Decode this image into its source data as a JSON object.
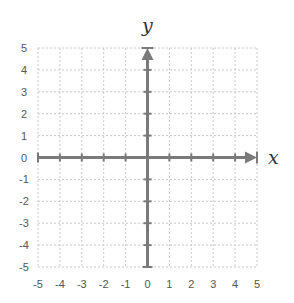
{
  "chart_data": {
    "type": "scatter",
    "title": "",
    "xlabel": "x",
    "ylabel": "y",
    "xlim": [
      -5,
      5
    ],
    "ylim": [
      -5,
      5
    ],
    "grid": true,
    "legend": null,
    "x_ticks": [
      "-5",
      "-4",
      "-3",
      "-2",
      "-1",
      "0",
      "1",
      "2",
      "3",
      "4",
      "5"
    ],
    "y_ticks": [
      "5",
      "4",
      "3",
      "2",
      "1",
      "0",
      "-1",
      "-2",
      "-3",
      "-4",
      "-5"
    ],
    "series": [],
    "annotations": [
      "Coordinate plane with arrows on the positive x and y axes"
    ]
  },
  "colors": {
    "grid": "#c8c8c8",
    "axis": "#7a7a7a",
    "text": "#555555"
  }
}
